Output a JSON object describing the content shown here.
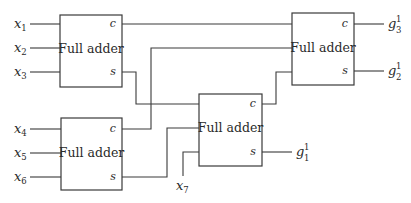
{
  "diagram": {
    "block_label": "Full adder",
    "ports": {
      "carry": "c",
      "sum": "s"
    },
    "blocks": [
      {
        "id": "fa1",
        "label": "Full adder",
        "inputs": [
          "x1",
          "x2",
          "x3"
        ]
      },
      {
        "id": "fa4",
        "label": "Full adder",
        "inputs": [
          "x4",
          "x5",
          "x6"
        ]
      },
      {
        "id": "fa2",
        "label": "Full adder",
        "inputs": [
          "fa1.s",
          "fa4.s",
          "x7"
        ]
      },
      {
        "id": "fa3",
        "label": "Full adder",
        "inputs": [
          "fa1.c",
          "fa4.c",
          "fa2.c"
        ]
      }
    ],
    "inputs": [
      {
        "base": "x",
        "sub": "1"
      },
      {
        "base": "x",
        "sub": "2"
      },
      {
        "base": "x",
        "sub": "3"
      },
      {
        "base": "x",
        "sub": "4"
      },
      {
        "base": "x",
        "sub": "5"
      },
      {
        "base": "x",
        "sub": "6"
      },
      {
        "base": "x",
        "sub": "7"
      }
    ],
    "outputs": [
      {
        "base": "g",
        "sub": "3",
        "sup": "1",
        "from": "fa3.c"
      },
      {
        "base": "g",
        "sub": "2",
        "sup": "1",
        "from": "fa3.s"
      },
      {
        "base": "g",
        "sub": "1",
        "sup": "1",
        "from": "fa2.s"
      }
    ]
  }
}
